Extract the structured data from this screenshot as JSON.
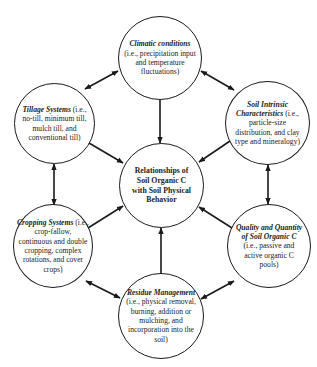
{
  "diagram": {
    "type": "hub-and-spoke concept diagram",
    "colors": {
      "stroke": "#1a1a1a",
      "text": "#222222",
      "background": "#ffffff"
    },
    "center": {
      "id": "center",
      "title": "Relationships of Soil Organic C with Soil Physical Behavior",
      "detail": ""
    },
    "nodes": [
      {
        "id": "climatic",
        "title": "Climatic conditions",
        "detail": " (i.e., precipitation input and temperature fluctuations)"
      },
      {
        "id": "tillage",
        "title": "Tillage Systems",
        "detail": " (i.e., no-till, minimum till, mulch till, and conventional till)"
      },
      {
        "id": "soil-intrinsic",
        "title": "Soil Intrinsic Characteristics",
        "detail": " (i.e., particle-size distribution, and clay type and mineralogy)"
      },
      {
        "id": "cropping",
        "title": "Cropping Systems",
        "detail": " (i.e., crop-fallow, continuous and double cropping, complex rotations, and cover crops)"
      },
      {
        "id": "quality",
        "title": "Quality and Quantity of Soil Organic C",
        "detail": " (i.e., passive and active organic C pools)"
      },
      {
        "id": "residue",
        "title": "Residue Management",
        "detail": " (i.e., physical removal, burning, addition or mulching, and incorporation into the soil)"
      }
    ],
    "edges": [
      {
        "from": "climatic",
        "to": "center",
        "arrow": "single"
      },
      {
        "from": "tillage",
        "to": "center",
        "arrow": "single"
      },
      {
        "from": "soil-intrinsic",
        "to": "center",
        "arrow": "single"
      },
      {
        "from": "cropping",
        "to": "center",
        "arrow": "single"
      },
      {
        "from": "quality",
        "to": "center",
        "arrow": "single"
      },
      {
        "from": "residue",
        "to": "center",
        "arrow": "single"
      },
      {
        "from": "tillage",
        "to": "climatic",
        "arrow": "double"
      },
      {
        "from": "climatic",
        "to": "soil-intrinsic",
        "arrow": "double"
      },
      {
        "from": "soil-intrinsic",
        "to": "quality",
        "arrow": "double"
      },
      {
        "from": "quality",
        "to": "residue",
        "arrow": "double"
      },
      {
        "from": "residue",
        "to": "cropping",
        "arrow": "double"
      },
      {
        "from": "cropping",
        "to": "tillage",
        "arrow": "double"
      }
    ]
  }
}
